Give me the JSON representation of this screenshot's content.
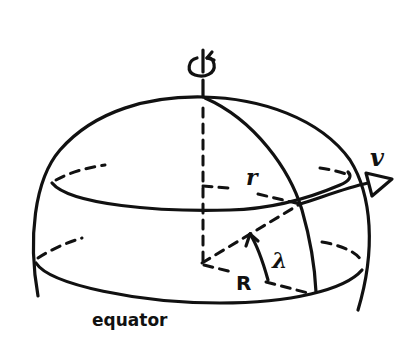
{
  "diagram": {
    "ink_color": "#111111",
    "background_color": "#ffffff",
    "labels": {
      "rotation_symbol": "rotation-arrow",
      "small_radius": "r",
      "velocity": "v",
      "sphere_radius": "R",
      "latitude_angle": "λ",
      "equator": "equator"
    },
    "elements": [
      {
        "name": "rotation-axis",
        "style": "solid above sphere, dashed inside"
      },
      {
        "name": "sphere-outline",
        "style": "solid"
      },
      {
        "name": "latitude-circle",
        "style": "solid front, dashed back"
      },
      {
        "name": "equator-circle",
        "style": "solid front, dashed back"
      },
      {
        "name": "meridian",
        "style": "solid"
      },
      {
        "name": "radius-r",
        "style": "dashed"
      },
      {
        "name": "radius-R",
        "style": "dashed"
      },
      {
        "name": "velocity-arrow",
        "style": "solid, open triangle head"
      },
      {
        "name": "latitude-angle-arc",
        "style": "solid with arrowhead"
      }
    ]
  }
}
